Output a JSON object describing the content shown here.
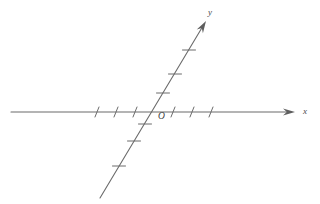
{
  "figure": {
    "kind": "oblique-coordinate-axes-diagram",
    "background_color": "#ffffff",
    "stroke_color": "#6b6b6b",
    "tick_color": "#6b6b6b",
    "label_color": "#4a4a4a",
    "origin_label": "O",
    "x_axis_label": "x",
    "y_axis_label": "y",
    "top_cropped_text": "",
    "width": 320,
    "height": 204
  },
  "chart_data": {
    "type": "line",
    "title": "",
    "xlabel": "x",
    "ylabel": "y",
    "origin_label": "O",
    "grid": false,
    "legend": null,
    "axes": [
      {
        "name": "x-axis",
        "orientation": "horizontal",
        "start": [
          11,
          112
        ],
        "end": [
          295,
          112
        ],
        "arrow_at": "end",
        "label": "x",
        "label_position": [
          303,
          115
        ],
        "tick_count": 6,
        "tick_labels": [],
        "tick_orientation": "slanted",
        "ticks": [
          {
            "x": 97,
            "y": 112,
            "side": "negative"
          },
          {
            "x": 116,
            "y": 112,
            "side": "negative"
          },
          {
            "x": 135,
            "y": 112,
            "side": "negative"
          },
          {
            "x": 173,
            "y": 112,
            "side": "positive"
          },
          {
            "x": 192,
            "y": 112,
            "side": "positive"
          },
          {
            "x": 211,
            "y": 112,
            "side": "positive"
          }
        ]
      },
      {
        "name": "y-axis-oblique",
        "orientation": "oblique",
        "start": [
          100,
          198
        ],
        "end": [
          206,
          21
        ],
        "arrow_at": "end",
        "label": "y",
        "label_position": [
          210,
          16
        ],
        "tick_count": 6,
        "tick_labels": [],
        "tick_orientation": "horizontal",
        "ticks": [
          {
            "x": 119,
            "y": 166,
            "side": "negative"
          },
          {
            "x": 134,
            "y": 141,
            "side": "negative"
          },
          {
            "x": 145,
            "y": 124,
            "side": "negative"
          },
          {
            "x": 163,
            "y": 93,
            "side": "positive"
          },
          {
            "x": 175,
            "y": 74,
            "side": "positive"
          },
          {
            "x": 189,
            "y": 50,
            "side": "positive"
          }
        ]
      }
    ],
    "origin": {
      "x": 154,
      "y": 112
    },
    "series": [],
    "annotations": [
      {
        "text": "O",
        "x": 160,
        "y": 121,
        "role": "origin-label"
      },
      {
        "text": "x",
        "x": 305,
        "y": 116,
        "role": "axis-label"
      },
      {
        "text": "y",
        "x": 210,
        "y": 17,
        "role": "axis-label"
      }
    ]
  }
}
